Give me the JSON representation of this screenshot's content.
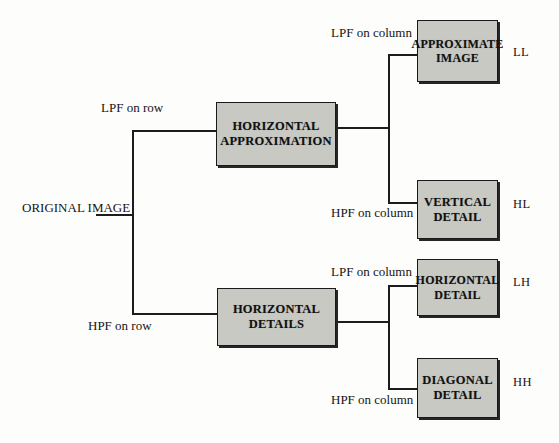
{
  "diagram": {
    "nodes": {
      "original": {
        "line1": "ORIGINAL",
        "line2": "IMAGE"
      },
      "horizontal_approximation": {
        "line1": "HORIZONTAL",
        "line2": "APPROXIMATION"
      },
      "horizontal_details": {
        "line1": "HORIZONTAL",
        "line2": "DETAILS"
      },
      "approximate_image": {
        "line1": "APPROXIMATE",
        "line2": "IMAGE"
      },
      "vertical_detail": {
        "line1": "VERTICAL",
        "line2": "DETAIL"
      },
      "horizontal_detail": {
        "line1": "HORIZONTAL",
        "line2": "DETAIL"
      },
      "diagonal_detail": {
        "line1": "DIAGONAL",
        "line2": "DETAIL"
      }
    },
    "edge_labels": {
      "lpf_on_row": "LPF on row",
      "hpf_on_row": "HPF on row",
      "lpf_on_column_top": "LPF on column",
      "hpf_on_column_top": "HPF on column",
      "lpf_on_column_bottom": "LPF on column",
      "hpf_on_column_bottom": "HPF on column"
    },
    "subband_tags": {
      "ll": "LL",
      "hl": "HL",
      "lh": "LH",
      "hh": "HH"
    },
    "colors": {
      "box_fill": "#c9c9c4",
      "box_border": "#1a1a1a",
      "line": "#1c1c1c",
      "text": "#151515",
      "background": "#fdfdfc"
    }
  }
}
